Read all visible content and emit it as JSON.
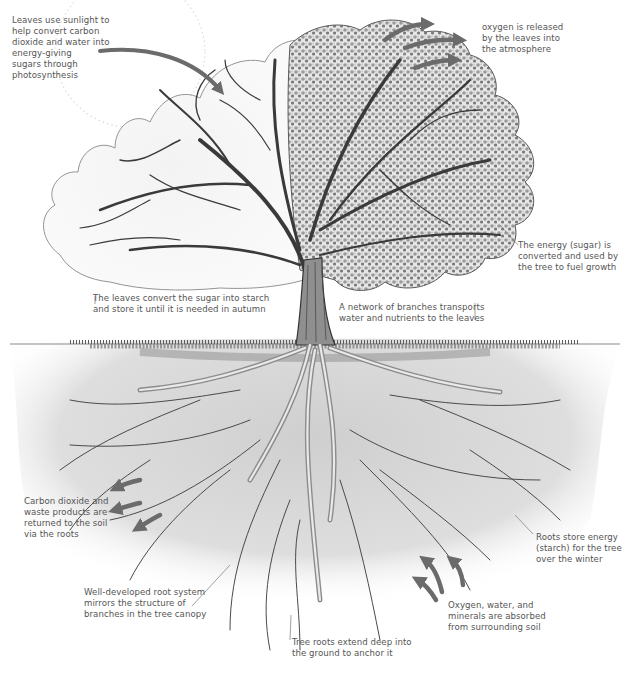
{
  "diagram": {
    "type": "annotated-illustration",
    "colors": {
      "background": "#ffffff",
      "ink": "#3a3a3a",
      "arrow": "#6b6b6b",
      "soil": "#d9d9d9",
      "text": "#555555"
    },
    "annotations": [
      {
        "id": "photosynthesis",
        "lines": [
          "Leaves use sunlight to",
          "help convert carbon",
          "dioxide and water into",
          "energy-giving",
          "sugars through",
          "photosynthesis"
        ]
      },
      {
        "id": "oxygen-release",
        "lines": [
          "oxygen is released",
          "by the leaves into",
          "the atmosphere"
        ]
      },
      {
        "id": "energy-growth",
        "lines": [
          "The energy (sugar) is",
          "converted and used by",
          "the tree to fuel growth"
        ]
      },
      {
        "id": "starch-storage-leaves",
        "lines": [
          "The leaves convert the sugar into starch",
          "and store it until it is needed in autumn"
        ]
      },
      {
        "id": "branch-network",
        "lines": [
          "A network of branches transports",
          "water and nutrients to the leaves"
        ]
      },
      {
        "id": "co2-return",
        "lines": [
          "Carbon dioxide and",
          "waste products are",
          "returned to the soil",
          "via the roots"
        ]
      },
      {
        "id": "roots-store-energy",
        "lines": [
          "Roots store energy",
          "(starch) for the tree",
          "over the winter"
        ]
      },
      {
        "id": "root-system-mirror",
        "lines": [
          "Well-developed root system",
          "mirrors the structure of",
          "branches in the tree canopy"
        ]
      },
      {
        "id": "absorption",
        "lines": [
          "Oxygen, water, and",
          "minerals are absorbed",
          "from surrounding soil"
        ]
      },
      {
        "id": "anchor-roots",
        "lines": [
          "Tree roots extend deep into",
          "the ground to anchor it"
        ]
      }
    ],
    "arrows": [
      {
        "id": "sunlight-in",
        "direction": "into-canopy",
        "count": 1
      },
      {
        "id": "oxygen-out",
        "direction": "up-right",
        "count": 3
      },
      {
        "id": "co2-out",
        "direction": "down-left",
        "count": 3
      },
      {
        "id": "nutrients-in",
        "direction": "up",
        "count": 3
      }
    ]
  }
}
